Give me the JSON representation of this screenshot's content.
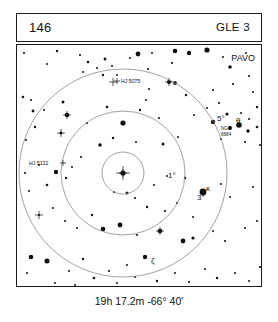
{
  "header": {
    "page_number": "146",
    "chart_code": "GLE 3"
  },
  "caption": "19h 17.2m  -66° 40'",
  "constellation_label": "PAVO",
  "rings": [
    {
      "label": "1°",
      "radius_deg": 1,
      "r_px": 21,
      "label_x": 151,
      "label_y": 133
    },
    {
      "label": "3°",
      "radius_deg": 3,
      "r_px": 62,
      "label_x": 180,
      "label_y": 155
    },
    {
      "label": "5°",
      "radius_deg": 5,
      "r_px": 104,
      "label_x": 200,
      "label_y": 76
    }
  ],
  "center": {
    "x": 106,
    "y": 128
  },
  "object_labels": [
    {
      "name": "HJ 5075",
      "text": "HJ 5075",
      "x": 104,
      "y": 38,
      "anchor": "start"
    },
    {
      "name": "HJ 5132",
      "text": "HJ 5132",
      "x": 12,
      "y": 120,
      "anchor": "start"
    },
    {
      "name": "NGC 6684",
      "text": "NGC",
      "x": 204,
      "y": 85,
      "anchor": "start"
    },
    {
      "name": "NGC 6684 number",
      "text": "6684",
      "x": 204,
      "y": 91,
      "anchor": "start"
    }
  ],
  "star_labels": [
    {
      "name": "theta-pavonis",
      "text": "θ",
      "x": 219,
      "y": 78
    },
    {
      "name": "kappa-pavonis",
      "text": "κ",
      "x": 189,
      "y": 146
    },
    {
      "name": "zeta-pavonis",
      "text": "ζ",
      "x": 134,
      "y": 218
    }
  ],
  "colors": {
    "ink": "#111111",
    "frame": "#1b1b1b",
    "ring": "#8a8a8a",
    "background": "#ffffff"
  },
  "chart_data": {
    "type": "scatter",
    "title": "GLE 3",
    "xlabel": "",
    "ylabel": "",
    "grid": false,
    "legend": false,
    "note": "Star finder chart centered on 19h 17.2m -66° 40' in Pavo; concentric rings mark 1°, 3° and 5° radii. Point size encodes stellar magnitude (larger = brighter).",
    "center_coordinates": {
      "ra": "19h 17.2m",
      "dec": "-66° 40'"
    },
    "ring_radii_deg": [
      1,
      3,
      5
    ],
    "stars": [
      {
        "x": 7,
        "y": 8,
        "r": 1.1
      },
      {
        "x": 40,
        "y": 6,
        "r": 1.2
      },
      {
        "x": 30,
        "y": 19,
        "r": 1.0
      },
      {
        "x": 63,
        "y": 10,
        "r": 1.1
      },
      {
        "x": 71,
        "y": 17,
        "r": 1.3
      },
      {
        "x": 80,
        "y": 23,
        "r": 1.0
      },
      {
        "x": 88,
        "y": 14,
        "r": 1.4
      },
      {
        "x": 95,
        "y": 21,
        "r": 1.0
      },
      {
        "x": 86,
        "y": 30,
        "r": 1.2
      },
      {
        "x": 100,
        "y": 30,
        "r": 1.0
      },
      {
        "x": 66,
        "y": 27,
        "r": 1.0
      },
      {
        "x": 121,
        "y": 9,
        "r": 2.4
      },
      {
        "x": 113,
        "y": 13,
        "r": 1.0
      },
      {
        "x": 131,
        "y": 24,
        "r": 1.1
      },
      {
        "x": 155,
        "y": 18,
        "r": 1.1
      },
      {
        "x": 135,
        "y": 8,
        "r": 1.0
      },
      {
        "x": 158,
        "y": 6,
        "r": 2.3
      },
      {
        "x": 172,
        "y": 8,
        "r": 2.2
      },
      {
        "x": 190,
        "y": 5,
        "r": 2.6
      },
      {
        "x": 206,
        "y": 12,
        "r": 1.0
      },
      {
        "x": 213,
        "y": 22,
        "r": 1.8
      },
      {
        "x": 229,
        "y": 8,
        "r": 1.0
      },
      {
        "x": 232,
        "y": 31,
        "r": 1.0
      },
      {
        "x": 216,
        "y": 39,
        "r": 1.1
      },
      {
        "x": 152,
        "y": 37,
        "r": 2.1
      },
      {
        "x": 158,
        "y": 38,
        "r": 1.9
      },
      {
        "x": 132,
        "y": 44,
        "r": 1.0
      },
      {
        "x": 169,
        "y": 50,
        "r": 1.2
      },
      {
        "x": 196,
        "y": 45,
        "r": 1.0
      },
      {
        "x": 202,
        "y": 58,
        "r": 1.1
      },
      {
        "x": 236,
        "y": 47,
        "r": 1.0
      },
      {
        "x": 240,
        "y": 62,
        "r": 1.2
      },
      {
        "x": 6,
        "y": 52,
        "r": 1.3
      },
      {
        "x": 14,
        "y": 55,
        "r": 1.0
      },
      {
        "x": 27,
        "y": 65,
        "r": 1.0
      },
      {
        "x": 16,
        "y": 66,
        "r": 1.4
      },
      {
        "x": 46,
        "y": 57,
        "r": 1.5
      },
      {
        "x": 50,
        "y": 70,
        "r": 2.3
      },
      {
        "x": 18,
        "y": 82,
        "r": 1.2
      },
      {
        "x": 9,
        "y": 95,
        "r": 1.1
      },
      {
        "x": 44,
        "y": 88,
        "r": 1.5
      },
      {
        "x": 70,
        "y": 78,
        "r": 1.1
      },
      {
        "x": 90,
        "y": 62,
        "r": 1.3
      },
      {
        "x": 123,
        "y": 65,
        "r": 1.2
      },
      {
        "x": 129,
        "y": 55,
        "r": 1.0
      },
      {
        "x": 142,
        "y": 73,
        "r": 1.1
      },
      {
        "x": 177,
        "y": 70,
        "r": 1.0
      },
      {
        "x": 190,
        "y": 63,
        "r": 1.0
      },
      {
        "x": 210,
        "y": 69,
        "r": 1.6
      },
      {
        "x": 224,
        "y": 68,
        "r": 1.0
      },
      {
        "x": 232,
        "y": 74,
        "r": 1.0
      },
      {
        "x": 196,
        "y": 77,
        "r": 2.2
      },
      {
        "x": 213,
        "y": 83,
        "r": 2.0
      },
      {
        "x": 222,
        "y": 80,
        "r": 2.8
      },
      {
        "x": 231,
        "y": 86,
        "r": 1.7
      },
      {
        "x": 240,
        "y": 82,
        "r": 1.3
      },
      {
        "x": 204,
        "y": 94,
        "r": 1.1
      },
      {
        "x": 228,
        "y": 97,
        "r": 1.0
      },
      {
        "x": 243,
        "y": 100,
        "r": 1.0
      },
      {
        "x": 106,
        "y": 78,
        "r": 2.6
      },
      {
        "x": 96,
        "y": 93,
        "r": 1.2
      },
      {
        "x": 119,
        "y": 97,
        "r": 1.0
      },
      {
        "x": 83,
        "y": 100,
        "r": 1.8
      },
      {
        "x": 146,
        "y": 99,
        "r": 1.5
      },
      {
        "x": 161,
        "y": 92,
        "r": 1.0
      },
      {
        "x": 64,
        "y": 112,
        "r": 1.1
      },
      {
        "x": 55,
        "y": 122,
        "r": 1.0
      },
      {
        "x": 39,
        "y": 127,
        "r": 2.2
      },
      {
        "x": 49,
        "y": 133,
        "r": 1.2
      },
      {
        "x": 30,
        "y": 140,
        "r": 1.3
      },
      {
        "x": 8,
        "y": 128,
        "r": 1.1
      },
      {
        "x": 12,
        "y": 146,
        "r": 1.0
      },
      {
        "x": 22,
        "y": 120,
        "r": 1.0
      },
      {
        "x": 106,
        "y": 128,
        "r": 2.6
      },
      {
        "x": 110,
        "y": 148,
        "r": 1.5
      },
      {
        "x": 97,
        "y": 147,
        "r": 1.0
      },
      {
        "x": 118,
        "y": 153,
        "r": 1.1
      },
      {
        "x": 137,
        "y": 140,
        "r": 1.0
      },
      {
        "x": 150,
        "y": 131,
        "r": 1.0
      },
      {
        "x": 168,
        "y": 133,
        "r": 1.2
      },
      {
        "x": 186,
        "y": 147,
        "r": 3.4
      },
      {
        "x": 204,
        "y": 139,
        "r": 1.0
      },
      {
        "x": 213,
        "y": 152,
        "r": 1.0
      },
      {
        "x": 236,
        "y": 142,
        "r": 1.0
      },
      {
        "x": 130,
        "y": 162,
        "r": 1.2
      },
      {
        "x": 148,
        "y": 166,
        "r": 1.1
      },
      {
        "x": 160,
        "y": 158,
        "r": 1.0
      },
      {
        "x": 176,
        "y": 172,
        "r": 1.0
      },
      {
        "x": 36,
        "y": 163,
        "r": 1.0
      },
      {
        "x": 22,
        "y": 170,
        "r": 1.1
      },
      {
        "x": 48,
        "y": 176,
        "r": 1.0
      },
      {
        "x": 60,
        "y": 183,
        "r": 1.0
      },
      {
        "x": 75,
        "y": 170,
        "r": 1.2
      },
      {
        "x": 86,
        "y": 184,
        "r": 2.3
      },
      {
        "x": 103,
        "y": 180,
        "r": 2.4
      },
      {
        "x": 120,
        "y": 190,
        "r": 1.0
      },
      {
        "x": 143,
        "y": 186,
        "r": 2.3
      },
      {
        "x": 166,
        "y": 196,
        "r": 2.4
      },
      {
        "x": 176,
        "y": 193,
        "r": 1.6
      },
      {
        "x": 196,
        "y": 186,
        "r": 1.0
      },
      {
        "x": 208,
        "y": 196,
        "r": 1.1
      },
      {
        "x": 228,
        "y": 183,
        "r": 1.0
      },
      {
        "x": 240,
        "y": 176,
        "r": 1.0
      },
      {
        "x": 128,
        "y": 212,
        "r": 2.2
      },
      {
        "x": 110,
        "y": 220,
        "r": 1.0
      },
      {
        "x": 92,
        "y": 226,
        "r": 1.1
      },
      {
        "x": 66,
        "y": 214,
        "r": 1.2
      },
      {
        "x": 52,
        "y": 226,
        "r": 1.0
      },
      {
        "x": 30,
        "y": 216,
        "r": 2.5
      },
      {
        "x": 14,
        "y": 212,
        "r": 2.3
      },
      {
        "x": 10,
        "y": 228,
        "r": 1.0
      },
      {
        "x": 38,
        "y": 238,
        "r": 1.0
      },
      {
        "x": 58,
        "y": 240,
        "r": 1.0
      },
      {
        "x": 77,
        "y": 233,
        "r": 1.3
      },
      {
        "x": 100,
        "y": 238,
        "r": 1.0
      },
      {
        "x": 118,
        "y": 232,
        "r": 1.0
      },
      {
        "x": 140,
        "y": 236,
        "r": 1.2
      },
      {
        "x": 158,
        "y": 228,
        "r": 1.0
      },
      {
        "x": 172,
        "y": 237,
        "r": 1.1
      },
      {
        "x": 188,
        "y": 224,
        "r": 1.0
      },
      {
        "x": 200,
        "y": 233,
        "r": 1.2
      },
      {
        "x": 218,
        "y": 228,
        "r": 1.0
      },
      {
        "x": 232,
        "y": 236,
        "r": 1.0
      },
      {
        "x": 243,
        "y": 222,
        "r": 1.1
      },
      {
        "x": 160,
        "y": 247,
        "r": 2.2
      },
      {
        "x": 186,
        "y": 251,
        "r": 1.0
      }
    ],
    "tick_marked_stars": [
      {
        "x": 44,
        "y": 88
      },
      {
        "x": 50,
        "y": 70
      },
      {
        "x": 96,
        "y": 37
      },
      {
        "x": 152,
        "y": 37
      },
      {
        "x": 22,
        "y": 170
      },
      {
        "x": 143,
        "y": 186
      },
      {
        "x": 88,
        "y": 245
      },
      {
        "x": 106,
        "y": 128
      }
    ]
  }
}
